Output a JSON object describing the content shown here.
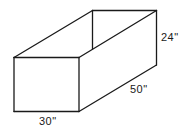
{
  "diagram": {
    "type": "open-box-isometric",
    "labels": {
      "width": "30\"",
      "length": "50\"",
      "height": "24\""
    },
    "dimensions": {
      "width_in": 30,
      "length_in": 50,
      "height_in": 24
    },
    "colors": {
      "line": "#1a1a1a",
      "background": "#ffffff"
    }
  }
}
